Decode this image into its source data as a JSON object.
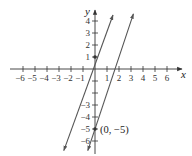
{
  "chart_data": {
    "type": "line",
    "title": "",
    "xlabel": "x",
    "ylabel": "y",
    "xlim": [
      -7,
      7
    ],
    "ylim": [
      -7,
      5
    ],
    "grid": false,
    "x_ticks": [
      -6,
      -5,
      -4,
      -3,
      -2,
      -1,
      1,
      2,
      3,
      4,
      5,
      6
    ],
    "x_tick_labels": [
      "−6",
      "−5",
      "−4",
      "−3",
      "−2",
      "−1",
      "1",
      "2",
      "3",
      "4",
      "5",
      "6"
    ],
    "y_ticks": [
      4,
      3,
      2,
      1,
      -3,
      -4,
      -5,
      -6
    ],
    "y_tick_labels": [
      "4",
      "3",
      "2",
      "1",
      "−3",
      "−4",
      "−5",
      "−6"
    ],
    "series": [
      {
        "name": "line through (0, 1)",
        "slope": 3,
        "intercept": 1,
        "x": [
          -2.6,
          1.5
        ],
        "y": [
          -6.8,
          4.5
        ]
      },
      {
        "name": "line through (0, -5)",
        "slope": 3,
        "intercept": -5,
        "x": [
          -0.6,
          3.2
        ],
        "y": [
          -6.8,
          4.6
        ]
      }
    ],
    "points": [
      {
        "x": 0,
        "y": 1,
        "label": ""
      },
      {
        "x": 0,
        "y": -5,
        "label": "(0, −5)"
      }
    ],
    "annotations": [
      "(0, −5)"
    ]
  },
  "labels": {
    "x_axis": "x",
    "y_axis": "y",
    "point_annotation": "(0, −5)"
  }
}
